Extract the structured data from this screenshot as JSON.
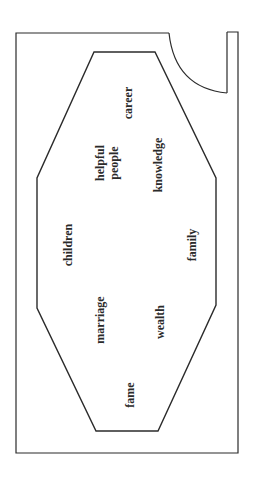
{
  "diagram": {
    "type": "bagua-floor-plan",
    "orientation": "rotated 90° counter-clockwise",
    "line_color": "#2b2b2b",
    "elements": {
      "outer_room": "room outline",
      "door": "door swing arc",
      "octagon": "bagua octagon"
    },
    "areas": [
      {
        "id": "career",
        "lines": [
          "career"
        ]
      },
      {
        "id": "helpful-people",
        "lines": [
          "helpful",
          "people"
        ]
      },
      {
        "id": "knowledge",
        "lines": [
          "knowledge"
        ]
      },
      {
        "id": "children",
        "lines": [
          "children"
        ]
      },
      {
        "id": "family",
        "lines": [
          "family"
        ]
      },
      {
        "id": "marriage",
        "lines": [
          "marriage"
        ]
      },
      {
        "id": "wealth",
        "lines": [
          "wealth"
        ]
      },
      {
        "id": "fame",
        "lines": [
          "fame"
        ]
      }
    ]
  }
}
